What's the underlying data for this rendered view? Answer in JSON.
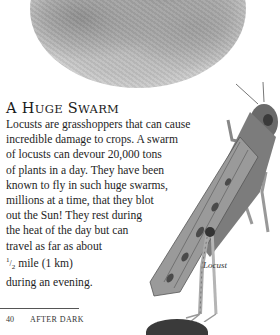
{
  "page": {
    "photo": {
      "icon": "desert-photo-oval",
      "description": "grayscale oval photograph of a locust on sandy ground"
    },
    "section": {
      "heading": {
        "first_letter": "A",
        "word1_cap": "H",
        "word1_rest": "UGE",
        "word2_cap": "S",
        "word2_rest": "WARM"
      },
      "lines": [
        "Locusts are grasshoppers that can cause",
        "incredible damage to crops.  A swarm",
        "of locusts can devour 20,000 tons",
        "of plants in a day.  They have been",
        "known to fly in such huge swarms,",
        "millions at a time, that they blot",
        "out the Sun!  They rest during",
        "the heat of the day but can",
        "travel as far as about"
      ],
      "fraction": {
        "numerator": "1",
        "denominator": "2"
      },
      "fraction_line_rest": " mile (1 km)",
      "last_line": "during an evening."
    },
    "illustration": {
      "icon": "locust-illustration",
      "caption": "Locust"
    },
    "footer": {
      "page_number": "40",
      "title": "AFTER DARK"
    }
  }
}
